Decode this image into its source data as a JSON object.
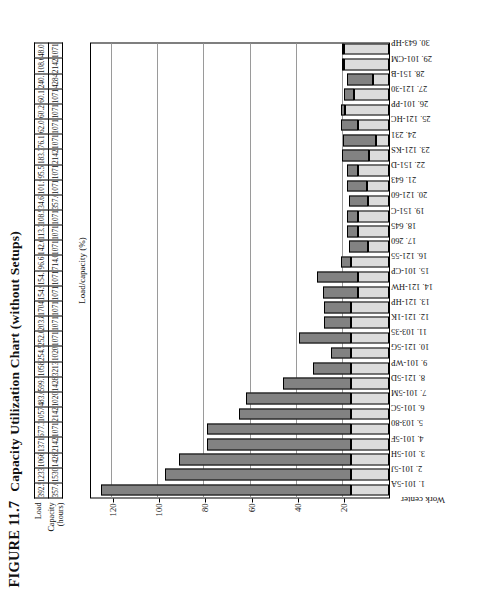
{
  "figure": {
    "number": "FIGURE 11.7",
    "title": "Capacity Utilization Chart (without Setups)"
  },
  "table": {
    "row_labels": {
      "load": "Load",
      "capacity": "Capacity\n(hours)"
    },
    "load_label": "Load",
    "capacity_label_line1": "Capacity",
    "capacity_label_line2": "(hours)",
    "load": [
      "392.5",
      "1233.5",
      "1066.6",
      "1371.8",
      "677.3",
      "1057.3",
      "483.0",
      "599.7",
      "1058.8",
      "254.5",
      "252.0",
      "203.8",
      "1704.0",
      "154.9",
      "154.3",
      "96.6",
      "142.6",
      "113.3",
      "108.5",
      "34.6",
      "101.9",
      "95.5",
      "183.3",
      "76.1",
      "62.0",
      "60.2",
      "60.1",
      "240.1",
      "108.6",
      "48.0"
    ],
    "capacity": [
      "357.0",
      "1530.0",
      "1428.0",
      "2142.0",
      "1071.0",
      "2142.0",
      "1020.0",
      "1428.0",
      "3213.0",
      "1020.0",
      "1071.0",
      "1071.0",
      "10710.0",
      "1071.0",
      "1071.0",
      "714.0",
      "1071.0",
      "1071.0",
      "1071.0",
      "357.0",
      "1071.0",
      "1071.0",
      "2142.0",
      "1071.0",
      "1071.0",
      "1071.0",
      "1071.0",
      "4284.0",
      "2142.0",
      "1071.0"
    ]
  },
  "chart_data": {
    "type": "bar",
    "title": "Capacity Utilization Chart (without Setups)",
    "ylabel": "Load/capacity (%)",
    "xlabel": "Work center",
    "ylim": [
      0,
      130
    ],
    "yticks": [
      20,
      40,
      60,
      80,
      100,
      120
    ],
    "grid": true,
    "legend": null,
    "orientation": "vertical-bars-on-rotated-page",
    "stacked": true,
    "categories": [
      "1.  101-5A",
      "2.  101-5J",
      "3.  101-5H",
      "4.  101-5F",
      "5.  103-80",
      "6.  101-5C",
      "7.  101-5M",
      "8.  121-5D",
      "9.  101-WP",
      "10.  121-5G",
      "11.  103-35",
      "12.  121-1K",
      "13.  121-HP",
      "14.  121-HW",
      "15.  101-CP",
      "16.  121-55",
      "17.  260",
      "18.  645",
      "19.  151-C",
      "20.  121-60",
      "21.  643",
      "22.  151-D",
      "23.  121-KS",
      "24.  231",
      "25.  121-HC",
      "26.  101-PP",
      "27.  121-30",
      "28.  151-B",
      "29.  101-CM",
      "30.  643-HP"
    ],
    "series": [
      {
        "name": "base",
        "color": "#dcdcdc",
        "values": [
          16.6,
          16.6,
          16.6,
          16.6,
          16.6,
          16.6,
          16.6,
          16.6,
          16.6,
          16.6,
          16.6,
          16.6,
          16.6,
          13.5,
          13.5,
          16.6,
          9.0,
          13.5,
          13.5,
          9.0,
          9.5,
          13.5,
          8.5,
          5.5,
          13.5,
          19.0,
          15.0,
          7.0,
          19.5,
          19.5
        ]
      },
      {
        "name": "top",
        "color": "#828282",
        "values": [
          108.4,
          80.4,
          74.4,
          62.4,
          62.4,
          48.4,
          45.4,
          29.4,
          16.4,
          8.4,
          22.4,
          11.4,
          11.4,
          15.0,
          17.5,
          4.4,
          8.5,
          4.5,
          4.5,
          8.5,
          8.5,
          4.5,
          12.0,
          14.5,
          7.5,
          2.0,
          4.5,
          11.0,
          0.5,
          0.5
        ]
      }
    ],
    "totals": [
      125.0,
      97.0,
      91.0,
      79.0,
      79.0,
      65.0,
      62.0,
      46.0,
      33.0,
      25.0,
      39.0,
      28.0,
      28.0,
      28.5,
      31.0,
      21.0,
      17.5,
      18.0,
      18.0,
      17.5,
      18.0,
      18.0,
      20.5,
      20.0,
      21.0,
      21.0,
      19.5,
      18.0,
      20.0,
      20.0
    ]
  }
}
